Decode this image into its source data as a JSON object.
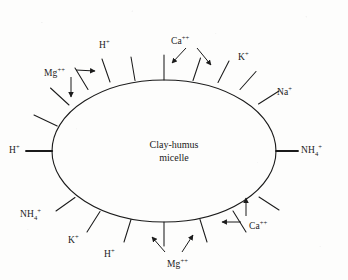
{
  "figure": {
    "background_color": "#fdfdfc",
    "ink_color": "#1b1b1b"
  },
  "micelle": {
    "label_line1": "Clay-humus",
    "label_line2": "micelle",
    "shape": "ellipse",
    "center_x": 164,
    "center_y": 151,
    "radius_x": 112,
    "radius_y": 71
  },
  "ions": [
    {
      "name": "hydrogen-top",
      "element": "H",
      "sub": "",
      "charge": "+",
      "x": 99,
      "y": 40
    },
    {
      "name": "calcium-top",
      "element": "Ca",
      "sub": "",
      "charge": "++",
      "x": 171,
      "y": 36
    },
    {
      "name": "potassium-top-right",
      "element": "K",
      "sub": "",
      "charge": "+",
      "x": 238,
      "y": 52
    },
    {
      "name": "sodium-right-upper",
      "element": "Na",
      "sub": "",
      "charge": "+",
      "x": 277,
      "y": 87
    },
    {
      "name": "magnesium-top-left",
      "element": "Mg",
      "sub": "",
      "charge": "++",
      "x": 44,
      "y": 68
    },
    {
      "name": "hydrogen-left",
      "element": "H",
      "sub": "",
      "charge": "+",
      "x": 9,
      "y": 145
    },
    {
      "name": "ammonium-right",
      "element": "NH",
      "sub": "4",
      "charge": "+",
      "x": 301,
      "y": 145
    },
    {
      "name": "ammonium-bottom-left",
      "element": "NH",
      "sub": "4",
      "charge": "+",
      "x": 20,
      "y": 209
    },
    {
      "name": "potassium-bottom-left",
      "element": "K",
      "sub": "",
      "charge": "+",
      "x": 68,
      "y": 235
    },
    {
      "name": "hydrogen-bottom-left",
      "element": "H",
      "sub": "",
      "charge": "+",
      "x": 104,
      "y": 249
    },
    {
      "name": "magnesium-bottom",
      "element": "Mg",
      "sub": "",
      "charge": "++",
      "x": 167,
      "y": 259
    },
    {
      "name": "calcium-bottom-right",
      "element": "Ca",
      "sub": "",
      "charge": "++",
      "x": 249,
      "y": 221
    }
  ],
  "exchange_sites": {
    "description": "Radial tick marks on the micelle surface representing cation exchange sites",
    "count": 16,
    "angles_deg": [
      198,
      214,
      231,
      249,
      266,
      283,
      300,
      318,
      336,
      354,
      12,
      30,
      48,
      66,
      84,
      102
    ]
  },
  "arrows": [
    {
      "name": "arrow-calcium-top-left",
      "from_x": 186,
      "from_y": 48,
      "to_x": 172,
      "to_y": 64
    },
    {
      "name": "arrow-calcium-top-right",
      "from_x": 197,
      "from_y": 48,
      "to_x": 212,
      "to_y": 66
    },
    {
      "name": "arrow-magnesium-right",
      "from_x": 76,
      "from_y": 70,
      "to_x": 96,
      "to_y": 71
    },
    {
      "name": "arrow-magnesium-down",
      "from_x": 71,
      "from_y": 76,
      "to_x": 71,
      "to_y": 98
    },
    {
      "name": "arrow-magnesium-bottom-left",
      "from_x": 165,
      "from_y": 252,
      "to_x": 151,
      "to_y": 236
    },
    {
      "name": "arrow-magnesium-bottom-right",
      "from_x": 182,
      "from_y": 252,
      "to_x": 194,
      "to_y": 234
    },
    {
      "name": "arrow-calcium-bottom-up",
      "from_x": 246,
      "from_y": 216,
      "to_x": 246,
      "to_y": 197
    },
    {
      "name": "arrow-calcium-bottom-left",
      "from_x": 241,
      "from_y": 222,
      "to_x": 221,
      "to_y": 222
    }
  ]
}
